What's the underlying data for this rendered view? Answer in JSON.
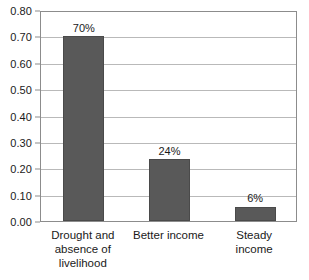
{
  "chart_data": {
    "type": "bar",
    "title": "",
    "subtitle": "",
    "xlabel": "",
    "ylabel": "",
    "ylim": [
      0.0,
      0.8
    ],
    "grid": true,
    "legend": false,
    "categories": [
      "Drought and absence of livelihood",
      "Better income",
      "Steady income"
    ],
    "category_lines": [
      [
        "Drought and",
        "absence of",
        "livelihood"
      ],
      [
        "Better income"
      ],
      [
        "Steady income"
      ]
    ],
    "values": [
      0.7,
      0.235,
      0.055
    ],
    "data_labels": [
      "70%",
      "24%",
      "6%"
    ],
    "ytick_labels": [
      "0.80",
      "0.70",
      "0.60",
      "0.50",
      "0.40",
      "0.30",
      "0.20",
      "0.10",
      "0.00"
    ],
    "ytick_values": [
      0.8,
      0.7,
      0.6,
      0.5,
      0.4,
      0.3,
      0.2,
      0.1,
      0.0
    ],
    "colors": {
      "bar_fill": "#595959",
      "bar_border": "#4a4a4a",
      "gridline": "#b9b9b9",
      "axis_border": "#8c8c8c",
      "text": "#1a1a1a",
      "background": "#ffffff"
    }
  }
}
